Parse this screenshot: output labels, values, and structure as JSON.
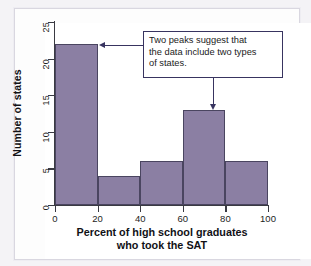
{
  "chart_data": {
    "type": "bar",
    "title": "",
    "subtitle": "",
    "xlabel_line1": "Percent of high school graduates",
    "xlabel_line2": "who took the SAT",
    "ylabel": "Number of states",
    "categories": [
      "0-20",
      "20-40",
      "40-60",
      "60-80",
      "80-100"
    ],
    "bin_edges": [
      0,
      20,
      40,
      60,
      80,
      100
    ],
    "values": [
      22,
      4,
      6,
      13,
      6
    ],
    "xlim": [
      0,
      100
    ],
    "ylim": [
      0,
      25
    ],
    "xticks": [
      "0",
      "20",
      "40",
      "60",
      "80",
      "100"
    ],
    "yticks": [
      "0",
      "5",
      "10",
      "15",
      "20",
      "25"
    ],
    "grid": false,
    "legend": null,
    "bar_color": "#8b7fa3",
    "bar_edge_color": "#4a4560",
    "annotations": [
      {
        "id": "two-peaks-note",
        "lines": [
          "Two peaks suggest that",
          "the data include two types",
          "of states."
        ],
        "border_color": "#383460",
        "points_to": [
          "0-20",
          "60-80"
        ]
      }
    ]
  }
}
